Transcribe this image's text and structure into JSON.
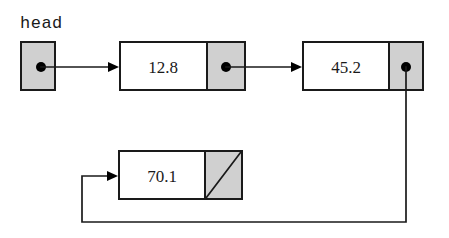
{
  "diagram": {
    "colors": {
      "pointer_cell_fill": "#d0d0d0",
      "data_cell_fill": "#ffffff",
      "stroke": "#1a1a1a",
      "dot": "#000000",
      "background": "#ffffff"
    },
    "head_label": "head",
    "head_pointer": {
      "name": "head-pointer-box",
      "fill": "#d0d0d0"
    },
    "nodes": [
      {
        "id": "node-1",
        "value": "12.8",
        "pointer": "link",
        "data_fill": "#ffffff",
        "pointer_fill": "#d0d0d0"
      },
      {
        "id": "node-2",
        "value": "45.2",
        "pointer": "link",
        "data_fill": "#ffffff",
        "pointer_fill": "#d0d0d0"
      },
      {
        "id": "node-3",
        "value": "70.1",
        "pointer": "null",
        "data_fill": "#ffffff",
        "pointer_fill": "#d0d0d0"
      }
    ],
    "links": [
      {
        "name": "link-head-to-node-1",
        "from": "head-pointer-box",
        "to": "node-1"
      },
      {
        "name": "link-node-1-to-node-2",
        "from": "node-1",
        "to": "node-2"
      },
      {
        "name": "link-node-2-to-node-3",
        "from": "node-2",
        "to": "node-3"
      }
    ]
  }
}
